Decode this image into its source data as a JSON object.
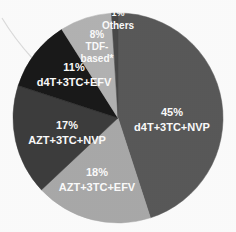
{
  "chart_data": {
    "type": "pie",
    "title": "",
    "subtitle": "",
    "xlabel": "",
    "ylabel": "",
    "legend_position": "none",
    "grid": false,
    "labels_inside": true,
    "start_angle_deg": 0,
    "direction": "clockwise",
    "total": 100,
    "units": "%",
    "categories": [
      "d4T+3TC+NVP",
      "AZT+3TC+EFV",
      "AZT+3TC+NVP",
      "d4T+3TC+EFV",
      "TDF-based*",
      "Others"
    ],
    "values": [
      45,
      18,
      17,
      11,
      8,
      1
    ],
    "colors": [
      "#5a5a5a",
      "#ababab",
      "#3e3e3e",
      "#1a1a1a",
      "#b5b5b5",
      "#4a4a4a"
    ],
    "slices": [
      {
        "name": "d4T+3TC+NVP",
        "value": 45,
        "percent_text": "45%",
        "label_text": "d4T+3TC+NVP",
        "color": "#5a5a5a",
        "label_x": 172,
        "label_y": 113
      },
      {
        "name": "AZT+3TC+EFV",
        "value": 18,
        "percent_text": "18%",
        "label_text": "AZT+3TC+EFV",
        "color": "#ababab",
        "label_x": 97,
        "label_y": 173
      },
      {
        "name": "AZT+3TC+NVP",
        "value": 17,
        "percent_text": "17%",
        "label_text": "AZT+3TC+NVP",
        "color": "#3e3e3e",
        "label_x": 67,
        "label_y": 126
      },
      {
        "name": "d4T+3TC+EFV",
        "value": 11,
        "percent_text": "11%",
        "label_text": "d4T+3TC+EFV",
        "color": "#1a1a1a",
        "label_x": 74,
        "label_y": 68
      },
      {
        "name": "TDF-based*",
        "value": 8,
        "percent_text": "8%",
        "label_text": "TDF-",
        "label_text2": "based*",
        "color": "#b5b5b5",
        "label_x": 97,
        "label_y": 35
      },
      {
        "name": "Others",
        "value": 1,
        "percent_text": "1%",
        "label_text": "Others",
        "color": "#4a4a4a",
        "label_x": 118,
        "label_y": 14
      }
    ],
    "geometry": {
      "cx": 118,
      "cy": 118,
      "r": 105
    }
  },
  "figure": {
    "background_color": "#ffffff",
    "alt_description": "Grayscale pie chart of antiretroviral regimen distribution"
  }
}
